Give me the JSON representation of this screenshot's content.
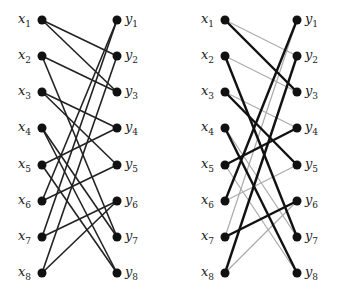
{
  "diagrams": [
    {
      "name": "left-graph",
      "left_x": 42,
      "right_x": 117,
      "left_nodes": [
        "x1",
        "x2",
        "x3",
        "x4",
        "x5",
        "x6",
        "x7",
        "x8"
      ],
      "right_nodes": [
        "y1",
        "y2",
        "y3",
        "y4",
        "y5",
        "y6",
        "y7",
        "y8"
      ],
      "edges": [
        {
          "from": "x1",
          "to": "y2",
          "style": "black"
        },
        {
          "from": "x1",
          "to": "y3",
          "style": "black"
        },
        {
          "from": "x2",
          "to": "y3",
          "style": "black"
        },
        {
          "from": "x2",
          "to": "y7",
          "style": "black"
        },
        {
          "from": "x3",
          "to": "y4",
          "style": "black"
        },
        {
          "from": "x3",
          "to": "y5",
          "style": "black"
        },
        {
          "from": "x4",
          "to": "y7",
          "style": "black"
        },
        {
          "from": "x4",
          "to": "y8",
          "style": "black"
        },
        {
          "from": "x5",
          "to": "y4",
          "style": "black"
        },
        {
          "from": "x5",
          "to": "y8",
          "style": "black"
        },
        {
          "from": "x6",
          "to": "y1",
          "style": "black"
        },
        {
          "from": "x6",
          "to": "y5",
          "style": "black"
        },
        {
          "from": "x7",
          "to": "y1",
          "style": "black"
        },
        {
          "from": "x7",
          "to": "y6",
          "style": "black"
        },
        {
          "from": "x8",
          "to": "y2",
          "style": "black"
        },
        {
          "from": "x8",
          "to": "y6",
          "style": "black"
        }
      ]
    },
    {
      "name": "right-graph",
      "left_x": 225,
      "right_x": 297,
      "left_nodes": [
        "x1",
        "x2",
        "x3",
        "x4",
        "x5",
        "x6",
        "x7",
        "x8"
      ],
      "right_nodes": [
        "y1",
        "y2",
        "y3",
        "y4",
        "y5",
        "y6",
        "y7",
        "y8"
      ],
      "edges": [
        {
          "from": "x1",
          "to": "y2",
          "style": "gray"
        },
        {
          "from": "x1",
          "to": "y3",
          "style": "bold"
        },
        {
          "from": "x2",
          "to": "y3",
          "style": "gray"
        },
        {
          "from": "x2",
          "to": "y7",
          "style": "bold"
        },
        {
          "from": "x3",
          "to": "y4",
          "style": "gray"
        },
        {
          "from": "x3",
          "to": "y5",
          "style": "bold"
        },
        {
          "from": "x4",
          "to": "y7",
          "style": "gray"
        },
        {
          "from": "x4",
          "to": "y8",
          "style": "bold"
        },
        {
          "from": "x5",
          "to": "y4",
          "style": "bold"
        },
        {
          "from": "x5",
          "to": "y8",
          "style": "gray"
        },
        {
          "from": "x6",
          "to": "y1",
          "style": "bold"
        },
        {
          "from": "x6",
          "to": "y5",
          "style": "gray"
        },
        {
          "from": "x7",
          "to": "y1",
          "style": "gray"
        },
        {
          "from": "x7",
          "to": "y6",
          "style": "bold"
        },
        {
          "from": "x8",
          "to": "y2",
          "style": "bold"
        },
        {
          "from": "x8",
          "to": "y6",
          "style": "gray"
        }
      ]
    }
  ],
  "row_y": [
    20,
    56,
    92,
    128,
    165,
    201,
    237,
    273
  ],
  "colors": {
    "node": "#111111",
    "black": "#222222",
    "bold": "#111111",
    "gray": "#aaaaaa"
  }
}
